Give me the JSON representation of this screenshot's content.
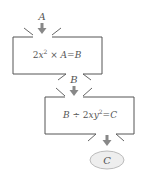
{
  "diagram": {
    "input_label": "A",
    "box1": {
      "expression": "2x² × A = B",
      "parts": {
        "pre": "2",
        "var": "x",
        "sup": "2",
        "op": " × ",
        "in": "A",
        "eq": "=",
        "out": "B"
      }
    },
    "mid_label": "B",
    "box2": {
      "expression": "B ÷ 2xy² = C",
      "parts": {
        "in": "B",
        "op": " ÷ 2",
        "var": "xy",
        "sup": "2",
        "eq": "=",
        "out": "C"
      }
    },
    "output_label": "C",
    "colors": {
      "stroke": "#555555",
      "arrow": "#888888",
      "ellipse_fill": "#eeeeee",
      "ellipse_stroke": "#bbbbbb"
    }
  }
}
